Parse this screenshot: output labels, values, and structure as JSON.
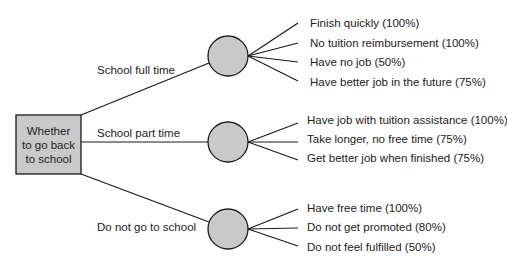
{
  "decision": {
    "lines": [
      "Whether",
      "to go back",
      "to school"
    ]
  },
  "colors": {
    "node_fill": "#c9c9c9",
    "stroke": "#1a1a1a",
    "text": "#222222"
  },
  "branches": [
    {
      "label": "School full time",
      "outcomes": [
        "Finish quickly (100%)",
        "No tuition reimbursement (100%)",
        "Have no job (50%)",
        "Have better job in the future (75%)"
      ]
    },
    {
      "label": "School part time",
      "outcomes": [
        "Have job with tuition assistance (100%)",
        "Take longer, no free time (75%)",
        "Get better job when finished (75%)"
      ]
    },
    {
      "label": "Do not go to school",
      "outcomes": [
        "Have free time (100%)",
        "Do not get promoted (80%)",
        "Do not feel fulfilled (50%)"
      ]
    }
  ]
}
